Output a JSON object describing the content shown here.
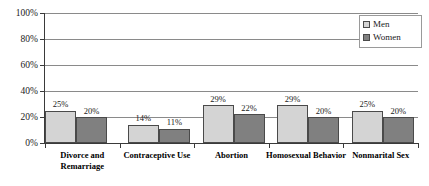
{
  "chart_data": {
    "type": "bar",
    "title": "",
    "subtitle": "",
    "xlabel": "",
    "ylabel": "",
    "ylim": [
      0,
      100
    ],
    "yticks": [
      "0%",
      "20%",
      "40%",
      "60%",
      "80%",
      "100%"
    ],
    "ytick_values": [
      0,
      20,
      40,
      60,
      80,
      100
    ],
    "grid": true,
    "legend_position": "top-right",
    "categories": [
      "Divorce and Remarriage",
      "Contraceptive Use",
      "Abortion",
      "Homosexual Behavior",
      "Nonmarital Sex"
    ],
    "series": [
      {
        "name": "Men",
        "color": "#d4d4d4",
        "values": [
          25,
          14,
          29,
          29,
          25
        ],
        "labels": [
          "25%",
          "14%",
          "29%",
          "29%",
          "25%"
        ]
      },
      {
        "name": "Women",
        "color": "#808080",
        "values": [
          20,
          11,
          22,
          20,
          20
        ],
        "labels": [
          "20%",
          "11%",
          "22%",
          "20%",
          "20%"
        ]
      }
    ]
  },
  "legend": {
    "entries": [
      {
        "label": "Men",
        "swatch_icon": "square-swatch-light"
      },
      {
        "label": "Women",
        "swatch_icon": "square-swatch-dark"
      }
    ]
  },
  "colors": {
    "men_bar": "#d4d4d4",
    "women_bar": "#808080",
    "bar_outline": "#4a4a4a",
    "gridline": "#8a8a8a",
    "axis": "#3a3a3a",
    "text": "#1a1a1a",
    "background": "#ffffff"
  }
}
